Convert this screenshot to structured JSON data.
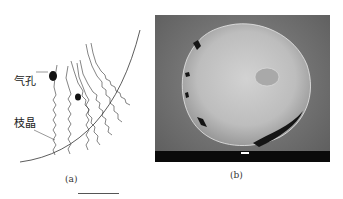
{
  "figure": {
    "panel_a": {
      "caption": "(a)",
      "annotations": [
        {
          "id": "pore",
          "text": "气孔"
        },
        {
          "id": "dendrite",
          "text": "枝晶"
        }
      ]
    },
    "panel_b": {
      "caption": "(b)",
      "image_type": "SEM micrograph of droplet cross-section",
      "colors": {
        "background": "#6f6f6f",
        "particle": "#c9c9c9",
        "pores": "#111111",
        "databar": "#0a0a0a"
      }
    }
  }
}
